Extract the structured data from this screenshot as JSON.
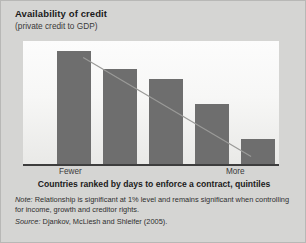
{
  "header": {
    "title": "Availability of credit",
    "subtitle": "(private credit to GDP)"
  },
  "axes": {
    "y_top_label": "More",
    "y_bottom_label": "Less",
    "x_left_label": "Fewer",
    "x_right_label": "More"
  },
  "caption": "Countries ranked by days to enforce a contract, quintiles",
  "notes": {
    "note_lead": "Note:",
    "note_text": " Relationship is significant at 1% level and remains significant when controlling for income, growth and creditor rights.",
    "source_lead": "Source:",
    "source_text": " Djankov, McLiesh and Shleifer (2005)."
  },
  "colors": {
    "bar": "#6e6e6e",
    "panel": "#d5d5d3",
    "plot_top": "#fcfcfc",
    "plot_bottom": "#e9e9e7",
    "axis": "#3d3d3d",
    "trend": "#9a9a98"
  },
  "chart_data": {
    "type": "bar",
    "title": "Availability of credit",
    "subtitle": "(private credit to GDP)",
    "xlabel": "Countries ranked by days to enforce a contract, quintiles",
    "ylabel": "private credit to GDP",
    "categories": [
      "1",
      "2",
      "3",
      "4",
      "5"
    ],
    "values": [
      0.92,
      0.77,
      0.69,
      0.49,
      0.2
    ],
    "ylim": [
      0,
      1
    ],
    "xtick_labels": [
      "Fewer",
      "More"
    ],
    "ytick_labels": [
      "Less",
      "More"
    ],
    "grid": false,
    "legend": "none",
    "trendline": {
      "type": "linear",
      "x0": 0.235,
      "y0": 0.865,
      "x1": 0.891,
      "y1": 0.061,
      "note": "downward-sloping fitted line across bars"
    },
    "annotations": [
      "Relationship is significant at 1% level and remains significant when controlling for income, growth and creditor rights.",
      "Djankov, McLiesh and Shleifer (2005)."
    ]
  },
  "layout": {
    "bar_geometry": [
      {
        "left": 34,
        "width": 34,
        "height_pct": 92
      },
      {
        "left": 80,
        "width": 34,
        "height_pct": 77
      },
      {
        "left": 126,
        "width": 34,
        "height_pct": 69
      },
      {
        "left": 172,
        "width": 34,
        "height_pct": 49
      },
      {
        "left": 218,
        "width": 34,
        "height_pct": 20
      }
    ]
  }
}
